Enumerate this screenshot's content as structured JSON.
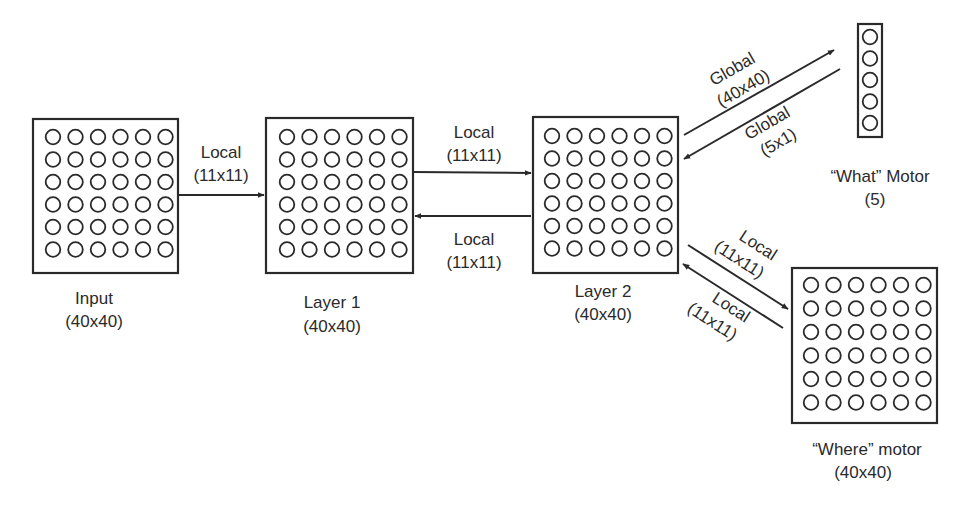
{
  "colors": {
    "ink": "#2a2a2a",
    "background": "#ffffff"
  },
  "layers": {
    "input": {
      "name": "Input",
      "size": "(40x40)",
      "grid": [
        6,
        6
      ]
    },
    "layer1": {
      "name": "Layer 1",
      "size": "(40x40)",
      "grid": [
        6,
        6
      ]
    },
    "layer2": {
      "name": "Layer 2",
      "size": "(40x40)",
      "grid": [
        6,
        6
      ]
    },
    "what": {
      "name": "“What” Motor",
      "size": "(5)",
      "grid": [
        1,
        5
      ]
    },
    "where": {
      "name": "“Where” motor",
      "size": "(40x40)",
      "grid": [
        6,
        6
      ]
    }
  },
  "connections": {
    "input_to_layer1": {
      "type": "Local",
      "size": "(11x11)"
    },
    "layer1_to_layer2": {
      "type": "Local",
      "size": "(11x11)"
    },
    "layer2_to_layer1": {
      "type": "Local",
      "size": "(11x11)"
    },
    "layer2_to_what": {
      "type": "Global",
      "size": "(40x40)"
    },
    "what_to_layer2": {
      "type": "Global",
      "size": "(5x1)"
    },
    "layer2_to_where": {
      "type": "Local",
      "size": "(11x11)"
    },
    "where_to_layer2": {
      "type": "Local",
      "size": "(11x11)"
    }
  }
}
